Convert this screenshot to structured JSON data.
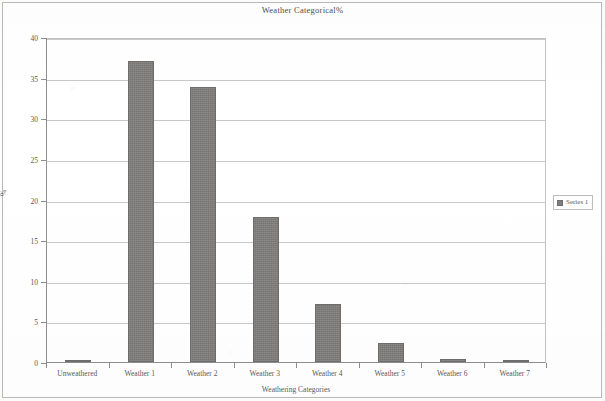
{
  "chart_data": {
    "type": "bar",
    "title": "Weather Categorical%",
    "xlabel": "Weathering Categories",
    "ylabel": "%",
    "categories": [
      "Unweathered",
      "Weather 1",
      "Weather 2",
      "Weather 3",
      "Weather 4",
      "Weather 5",
      "Weather 6",
      "Weather 7"
    ],
    "values": [
      0.1,
      37.0,
      33.8,
      17.8,
      7.2,
      2.3,
      0.4,
      0.1
    ],
    "series": [
      {
        "name": "Series 1",
        "values": [
          0.1,
          37.0,
          33.8,
          17.8,
          7.2,
          2.3,
          0.4,
          0.1
        ],
        "color": "#807e7d"
      }
    ],
    "ylim": [
      0,
      40
    ],
    "ytick_labels": [
      "0",
      "5",
      "10",
      "15",
      "20",
      "25",
      "30",
      "35",
      "40"
    ],
    "ytick_values": [
      0,
      5,
      10,
      15,
      20,
      25,
      30,
      35,
      40
    ],
    "grid": true,
    "grid_axis": "y",
    "legend_position": "right",
    "legend_entries": [
      "Series 1"
    ],
    "bar_color": "#807e7d",
    "plot_border_color": "#c3c3c3",
    "axis_color": "#8e8e8e",
    "text_color": "#5a5a5a"
  }
}
